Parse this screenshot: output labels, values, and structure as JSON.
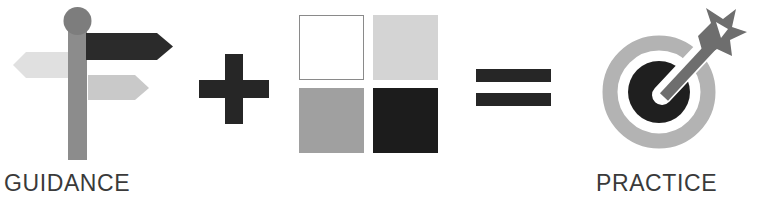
{
  "diagram": {
    "equation": "GUIDANCE + PRACTICE = IMPROVEMENT",
    "background_color": "#ffffff",
    "terms": [
      {
        "id": "guidance",
        "caption": "GUIDANCE",
        "icon": "signpost-icon",
        "description": "Signpost with three directional arrow signs and a ball finial",
        "parts": [
          {
            "name": "finial-ball",
            "color": "#7d7d7d"
          },
          {
            "name": "post",
            "color": "#8c8c8c"
          },
          {
            "name": "sign-left-light",
            "direction": "left",
            "color": "#e0e0e0"
          },
          {
            "name": "sign-right-dark",
            "direction": "right",
            "color": "#2b2b2b"
          },
          {
            "name": "sign-right-grey",
            "direction": "right",
            "color": "#c9c9c9"
          }
        ]
      },
      {
        "id": "practice",
        "caption": "PRACTICE",
        "icon": "four-squares-icon",
        "description": "Two-by-two grid of squares in increasing darkness",
        "squares": [
          {
            "position": "top-left",
            "color": "#ffffff",
            "border": "#8a8a8a"
          },
          {
            "position": "top-right",
            "color": "#d4d4d4",
            "border": "none"
          },
          {
            "position": "bottom-left",
            "color": "#a0a0a0",
            "border": "none"
          },
          {
            "position": "bottom-right",
            "color": "#1c1c1c",
            "border": "none"
          }
        ]
      },
      {
        "id": "improvement",
        "caption": "IMPROVEMENT",
        "icon": "target-dart-icon",
        "description": "Bullseye target struck by a dart in the centre",
        "parts": [
          {
            "name": "outer-ring",
            "color": "#b3b3b3"
          },
          {
            "name": "ring-gap",
            "color": "#ffffff"
          },
          {
            "name": "bullseye",
            "color": "#1f1f1f"
          },
          {
            "name": "dart",
            "color": "#6e6e6e"
          }
        ]
      }
    ],
    "operators": [
      {
        "id": "plus",
        "symbol": "+",
        "label": "plus-operator",
        "color": "#262626"
      },
      {
        "id": "equals",
        "symbol": "=",
        "label": "equals-operator",
        "color": "#262626"
      }
    ],
    "caption_color": "#3a3a3a"
  }
}
